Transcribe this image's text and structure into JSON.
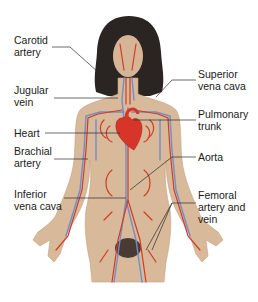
{
  "diagram": {
    "colors": {
      "background": "#ffffff",
      "skin": "#d8b99a",
      "skin_shadow": "#c49f80",
      "hair": "#2a2422",
      "artery": "#d23a26",
      "vein": "#6f8fc8",
      "heart": "#d8352a",
      "leader_line": "#2b2b2b",
      "text": "#1a1a1a"
    },
    "labels": [
      {
        "id": "carotid-artery",
        "text": "Carotid\nartery",
        "side": "left"
      },
      {
        "id": "jugular-vein",
        "text": "Jugular\nvein",
        "side": "left"
      },
      {
        "id": "heart",
        "text": "Heart",
        "side": "left"
      },
      {
        "id": "brachial-artery",
        "text": "Brachial\nartery",
        "side": "left"
      },
      {
        "id": "inferior-vena-cava",
        "text": "Inferior\nvena cava",
        "side": "left"
      },
      {
        "id": "superior-vena-cava",
        "text": "Superior\nvena cava",
        "side": "right"
      },
      {
        "id": "pulmonary-trunk",
        "text": "Pulmonary\ntrunk",
        "side": "right"
      },
      {
        "id": "aorta",
        "text": "Aorta",
        "side": "right"
      },
      {
        "id": "femoral-artery-and-vein",
        "text": "Femoral\nartery and\nvein",
        "side": "right"
      }
    ]
  }
}
